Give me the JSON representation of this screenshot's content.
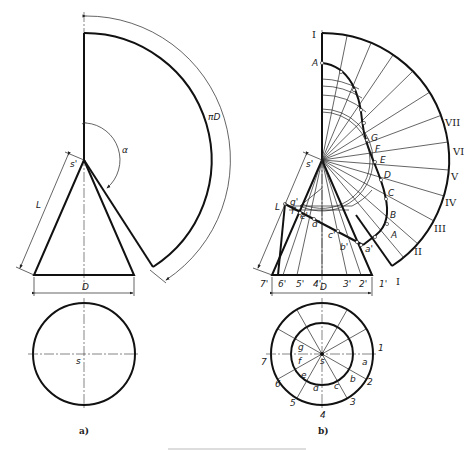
{
  "figure_a": {
    "caption": "a)",
    "labels": {
      "apex": "s'",
      "slant": "L",
      "angle": "α",
      "arc": "πD",
      "diameter": "D",
      "plan_center": "s"
    }
  },
  "figure_b": {
    "caption": "b)",
    "labels": {
      "apex": "s'",
      "slant": "L",
      "diameter": "D",
      "plan_center": "s"
    },
    "base_points": [
      "7'",
      "6'",
      "5'",
      "4'",
      "3'",
      "2'",
      "1'"
    ],
    "section_points_front": [
      "g'",
      "f'",
      "e'",
      "d'",
      "c'",
      "b'",
      "a'"
    ],
    "development_points": [
      "A",
      "B",
      "C",
      "D",
      "E",
      "F",
      "G"
    ],
    "development_generators": [
      "I",
      "II",
      "III",
      "IV",
      "V",
      "VI",
      "VII",
      "I"
    ],
    "plan_outer_numbers": [
      "1",
      "2",
      "3",
      "4",
      "5",
      "6",
      "7"
    ],
    "plan_inner_letters": [
      "a",
      "b",
      "c",
      "d",
      "e",
      "f",
      "g"
    ]
  },
  "caption_text": "",
  "colors": {
    "line": "#111111",
    "background": "#ffffff"
  }
}
